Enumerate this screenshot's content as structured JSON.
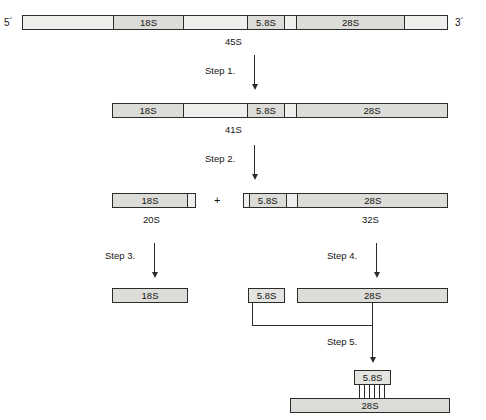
{
  "diagram": {
    "ends": {
      "five_prime": "5´",
      "three_prime": "3´"
    },
    "plus_sign": "+",
    "rows": [
      {
        "name": "pre-rRNA-45S",
        "label": "45S",
        "segments": [
          {
            "name": "5-ets",
            "label": ""
          },
          {
            "name": "18S",
            "label": "18S"
          },
          {
            "name": "its1",
            "label": ""
          },
          {
            "name": "5.8S",
            "label": "5.8S"
          },
          {
            "name": "its2",
            "label": ""
          },
          {
            "name": "28S",
            "label": "28S"
          },
          {
            "name": "3-ets",
            "label": ""
          }
        ]
      },
      {
        "name": "pre-rRNA-41S",
        "label": "41S",
        "segments": [
          {
            "name": "18S",
            "label": "18S"
          },
          {
            "name": "its1",
            "label": ""
          },
          {
            "name": "5.8S",
            "label": "5.8S"
          },
          {
            "name": "its2",
            "label": ""
          },
          {
            "name": "28S",
            "label": "28S"
          }
        ]
      },
      {
        "name": "pre-rRNA-20S",
        "label": "20S",
        "segments": [
          {
            "name": "18S",
            "label": "18S"
          },
          {
            "name": "its1-remnant",
            "label": ""
          }
        ]
      },
      {
        "name": "pre-rRNA-32S",
        "label": "32S",
        "segments": [
          {
            "name": "5.8S",
            "label": "5.8S"
          },
          {
            "name": "its2",
            "label": ""
          },
          {
            "name": "28S",
            "label": "28S"
          }
        ]
      },
      {
        "name": "mature-18S",
        "label": "",
        "segments": [
          {
            "name": "18S",
            "label": "18S"
          }
        ]
      },
      {
        "name": "mature-5.8S",
        "label": "",
        "segments": [
          {
            "name": "5.8S",
            "label": "5.8S"
          }
        ]
      },
      {
        "name": "mature-28S",
        "label": "",
        "segments": [
          {
            "name": "28S",
            "label": "28S"
          }
        ]
      },
      {
        "name": "hybrid-5.8S",
        "label": "",
        "segments": [
          {
            "name": "5.8S",
            "label": "5.8S"
          }
        ]
      },
      {
        "name": "hybrid-28S",
        "label": "",
        "segments": [
          {
            "name": "28S",
            "label": "28S"
          }
        ]
      }
    ],
    "steps": [
      {
        "name": "step-1",
        "label": "Step 1."
      },
      {
        "name": "step-2",
        "label": "Step 2."
      },
      {
        "name": "step-3",
        "label": "Step 3."
      },
      {
        "name": "step-4",
        "label": "Step 4."
      },
      {
        "name": "step-5",
        "label": "Step 5."
      }
    ]
  }
}
